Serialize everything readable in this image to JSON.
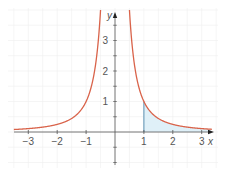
{
  "chart_data": {
    "type": "line",
    "title": "",
    "function": "y = 1/x^2",
    "xlabel": "x",
    "ylabel": "y",
    "xlim": [
      -3.5,
      3.4
    ],
    "ylim": [
      -1,
      4
    ],
    "grid": true,
    "x_ticks": [
      -3,
      -2,
      -1,
      1,
      2,
      3
    ],
    "x_tick_labels": [
      "−3",
      "−2",
      "−1",
      "1",
      "2",
      "3"
    ],
    "y_ticks": [
      1,
      2,
      3
    ],
    "y_tick_labels": [
      "1",
      "2",
      "3"
    ],
    "series": [
      {
        "name": "y = 1/x²",
        "color": "#d9634a",
        "x": [
          -3.4,
          -3,
          -2.5,
          -2,
          -1.5,
          -1,
          -0.8,
          -0.7,
          -0.6,
          -0.5,
          0.5,
          0.6,
          0.7,
          0.8,
          1,
          1.5,
          2,
          2.5,
          3,
          3.3
        ],
        "values": [
          0.087,
          0.111,
          0.16,
          0.25,
          0.444,
          1,
          1.5625,
          2.041,
          2.778,
          4,
          4,
          2.778,
          2.041,
          1.5625,
          1,
          0.444,
          0.25,
          0.16,
          0.111,
          0.092
        ]
      }
    ],
    "shaded_region": {
      "description": "area under curve for x >= 1",
      "x_from": 1,
      "x_to": 3.3,
      "fill": "#dff0f8",
      "edge_color": "#5a8fb0"
    }
  },
  "axes": {
    "x_label": "x",
    "y_label": "y"
  },
  "colors": {
    "curve": "#d9634a",
    "axis": "#555555",
    "grid": "#eeeeee",
    "shade": "#dff0f8"
  }
}
